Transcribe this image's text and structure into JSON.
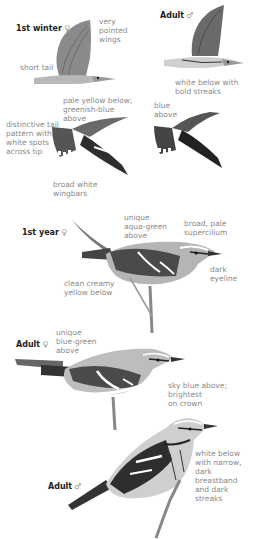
{
  "plate": {
    "figures": [
      {
        "id": "flight-1st-winter-female",
        "title": "1st winter",
        "sex_symbol": "♀",
        "labels": [
          "very\npointed\nwings",
          "short tail",
          "pale yellow below;\ngreenish-blue\nabove",
          "distinctive tail\npattern with\nwhite spots\nacross tip",
          "broad white\nwingbars"
        ]
      },
      {
        "id": "flight-adult-male",
        "title": "Adult",
        "sex_symbol": "♂",
        "labels": [
          "white below with\nbold streaks",
          "blue\nabove"
        ]
      },
      {
        "id": "perched-1st-year-female",
        "title": "1st year",
        "sex_symbol": "♀",
        "labels": [
          "unique\naqua-green\nabove",
          "broad, pale\nsupercilium",
          "dark\neyeline",
          "clean creamy\nyellow below"
        ]
      },
      {
        "id": "perched-adult-female",
        "title": "Adult",
        "sex_symbol": "♀",
        "labels": [
          "unique\nblue-green\nabove",
          "sky blue above;\nbrightest\non crown"
        ]
      },
      {
        "id": "perched-adult-male",
        "title": "Adult",
        "sex_symbol": "♂",
        "labels": [
          "white below\nwith narrow,\ndark breastband\nand dark streaks"
        ]
      }
    ]
  }
}
